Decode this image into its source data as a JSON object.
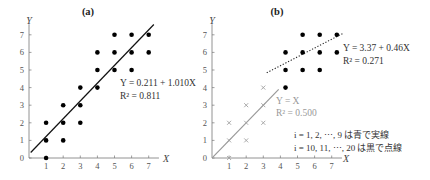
{
  "chart_data": [
    {
      "type": "scatter",
      "title": "(a)",
      "xlabel": "X",
      "ylabel": "Y",
      "xlim": [
        0,
        7.5
      ],
      "ylim": [
        0,
        7.5
      ],
      "xticks": [
        "1",
        "2",
        "3",
        "4",
        "5",
        "6",
        "7"
      ],
      "yticks": [
        "0",
        "1",
        "2",
        "3",
        "4",
        "5",
        "6",
        "7"
      ],
      "grid": false,
      "points": [
        [
          1,
          0
        ],
        [
          1,
          1
        ],
        [
          1,
          2
        ],
        [
          2,
          1
        ],
        [
          2,
          2
        ],
        [
          2,
          3
        ],
        [
          3,
          2
        ],
        [
          3,
          3
        ],
        [
          3,
          4
        ],
        [
          4,
          4
        ],
        [
          4,
          5
        ],
        [
          4,
          6
        ],
        [
          5,
          5
        ],
        [
          5,
          6
        ],
        [
          5,
          7
        ],
        [
          6,
          5
        ],
        [
          6,
          6
        ],
        [
          6,
          7
        ],
        [
          7,
          6
        ],
        [
          7,
          7
        ]
      ],
      "fit": {
        "intercept": 0.211,
        "slope": 1.01,
        "style": "solid",
        "x_range": [
          0.1,
          7.3
        ]
      },
      "annotation": {
        "equation": "Y = 0.211 + 1.010X",
        "r2": "R² = 0.811"
      }
    },
    {
      "type": "scatter",
      "title": "(b)",
      "xlabel": "X",
      "ylabel": "Y",
      "xlim": [
        0,
        7.5
      ],
      "ylim": [
        0,
        7.5
      ],
      "xticks": [
        "1",
        "2",
        "3",
        "4",
        "5",
        "6",
        "7"
      ],
      "yticks": [
        "0",
        "1",
        "2",
        "3",
        "4",
        "5",
        "6",
        "7"
      ],
      "grid": false,
      "series": [
        {
          "name": "i = 1, 2, ..., 9",
          "marker": "x",
          "color": "#a0a0a0",
          "points": [
            [
              1,
              0
            ],
            [
              1,
              1
            ],
            [
              1,
              2
            ],
            [
              2,
              1
            ],
            [
              2,
              2
            ],
            [
              2,
              3
            ],
            [
              3,
              2
            ],
            [
              3,
              3
            ],
            [
              3,
              4
            ]
          ],
          "fit": {
            "intercept": 0,
            "slope": 1,
            "style": "solid",
            "x_range": [
              0.05,
              3.9
            ]
          },
          "annotation": {
            "equation": "Y = X",
            "r2": "R² = 0.500"
          }
        },
        {
          "name": "i = 10, 11, ..., 20",
          "marker": "dot",
          "color": "#000000",
          "points": [
            [
              4.3,
              4
            ],
            [
              4.3,
              5
            ],
            [
              4.3,
              6
            ],
            [
              5.3,
              5
            ],
            [
              5.3,
              6
            ],
            [
              5.3,
              7
            ],
            [
              6.3,
              5
            ],
            [
              6.3,
              6
            ],
            [
              6.3,
              7
            ],
            [
              7.3,
              6
            ],
            [
              7.3,
              7
            ]
          ],
          "fit": {
            "intercept": 3.37,
            "slope": 0.46,
            "style": "dotted",
            "x_range": [
              3.2,
              8.4
            ]
          },
          "annotation": {
            "equation": "Y = 3.37 + 0.46X",
            "r2": "R² = 0.271"
          }
        }
      ],
      "notes": [
        "i = 1, 2, ⋯, 9 は青で実線",
        "i = 10, 11, ⋯, 20 は黒で点線"
      ]
    }
  ],
  "panels": {
    "a": {
      "title": "(a)",
      "xlabel": "X",
      "ylabel": "Y",
      "eq": "Y = 0.211 + 1.010X",
      "r2": "R² = 0.811"
    },
    "b": {
      "title": "(b)",
      "xlabel": "X",
      "ylabel": "Y",
      "eq1": "Y = 3.37 + 0.46X",
      "r2_1": "R² = 0.271",
      "eq2": "Y = X",
      "r2_2": "R² = 0.500",
      "note1": "i = 1, 2, ⋯, 9 は青で実線",
      "note2": "i = 10, 11, ⋯, 20 は黒で点線"
    }
  }
}
